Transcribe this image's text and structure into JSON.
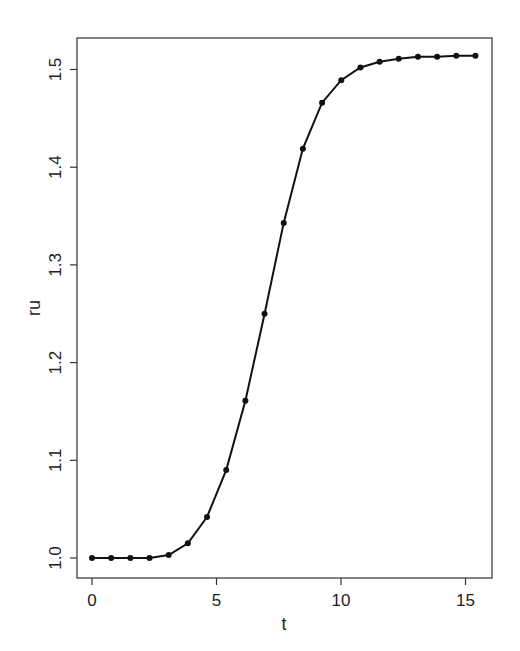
{
  "chart_data": {
    "type": "line",
    "title": "",
    "xlabel": "t",
    "ylabel": "ru",
    "xlim": [
      -0.6,
      16.0
    ],
    "ylim": [
      0.979,
      1.535
    ],
    "x_ticks": [
      0,
      5,
      10,
      15
    ],
    "x_tick_labels": [
      "0",
      "5",
      "10",
      "15"
    ],
    "y_ticks": [
      1.0,
      1.1,
      1.2,
      1.3,
      1.4,
      1.5
    ],
    "y_tick_labels": [
      "1.0",
      "1.1",
      "1.2",
      "1.3",
      "1.4",
      "1.5"
    ],
    "grid": false,
    "legend": null,
    "series": [
      {
        "name": "ru",
        "markers": true,
        "color": "#111111",
        "x": [
          0,
          0.77,
          1.54,
          2.31,
          3.08,
          3.85,
          4.62,
          5.39,
          6.16,
          6.93,
          7.7,
          8.47,
          9.24,
          10.01,
          10.78,
          11.55,
          12.32,
          13.09,
          13.86,
          14.63,
          15.4
        ],
        "y": [
          1.0,
          1.0,
          1.0,
          1.0,
          1.003,
          1.015,
          1.042,
          1.09,
          1.161,
          1.25,
          1.343,
          1.419,
          1.466,
          1.489,
          1.502,
          1.508,
          1.511,
          1.513,
          1.513,
          1.514,
          1.514
        ]
      }
    ]
  },
  "colors": {
    "axis": "#333333",
    "line": "#111111",
    "background": "#ffffff"
  }
}
